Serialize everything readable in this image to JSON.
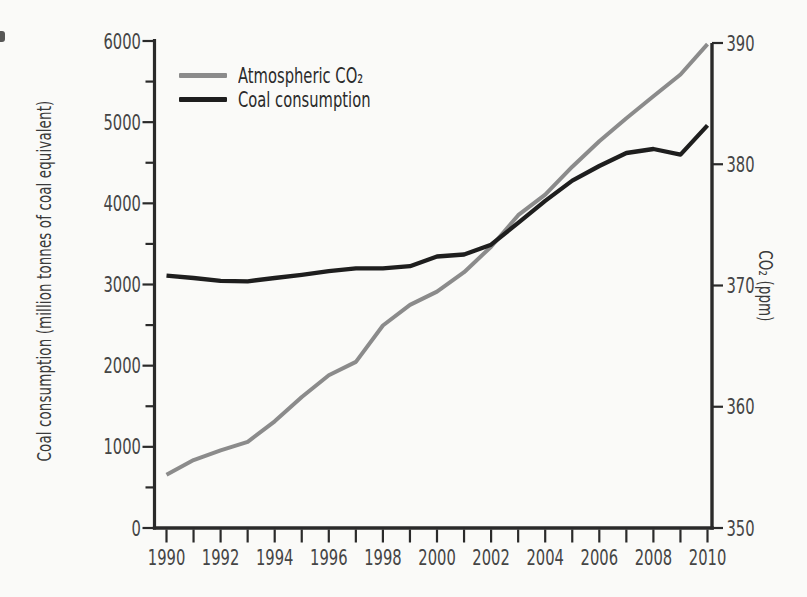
{
  "chart_data": {
    "type": "line",
    "title": "",
    "x": [
      1990,
      1991,
      1992,
      1993,
      1994,
      1995,
      1996,
      1997,
      1998,
      1999,
      2000,
      2001,
      2002,
      2003,
      2004,
      2005,
      2006,
      2007,
      2008,
      2009,
      2010
    ],
    "series": [
      {
        "name": "Atmospheric CO₂",
        "axis": "right",
        "color": "#8b8b8b",
        "stroke_width": 4,
        "values": [
          354.4,
          355.6,
          356.4,
          357.1,
          358.8,
          360.8,
          362.6,
          363.7,
          366.7,
          368.4,
          369.5,
          371.1,
          373.2,
          375.8,
          377.5,
          379.8,
          381.9,
          383.8,
          385.6,
          387.4,
          389.9
        ]
      },
      {
        "name": "Coal consumption",
        "axis": "left",
        "color": "#1e1e1e",
        "stroke_width": 4.3,
        "values": [
          3110,
          3080,
          3045,
          3040,
          3080,
          3120,
          3165,
          3200,
          3200,
          3225,
          3345,
          3370,
          3490,
          3760,
          4030,
          4280,
          4460,
          4620,
          4670,
          4600,
          4960
        ]
      }
    ],
    "left_axis": {
      "label": "Coal consumption (million tonnes of coal equivalent)",
      "min": 0,
      "max": 6000,
      "major_step": 1000,
      "minor_step": 500,
      "tick_labels": [
        "0",
        "1000",
        "2000",
        "3000",
        "4000",
        "5000",
        "6000"
      ]
    },
    "right_axis": {
      "label": "CO₂ (ppm)",
      "min": 350,
      "max": 390,
      "major_step": 10,
      "tick_labels": [
        "350",
        "360",
        "370",
        "380",
        "390"
      ]
    },
    "x_axis": {
      "min": 1990,
      "max": 2010,
      "tick_step": 1,
      "label_step": 2,
      "tick_labels": [
        "1990",
        "1992",
        "1994",
        "1996",
        "1998",
        "2000",
        "2002",
        "2004",
        "2006",
        "2008",
        "2010"
      ]
    },
    "legend": {
      "position": "top-left-inside",
      "items": [
        {
          "label": "Atmospheric CO₂",
          "color": "#8b8b8b"
        },
        {
          "label": "Coal consumption",
          "color": "#1e1e1e"
        }
      ]
    },
    "grid": false
  },
  "colors": {
    "background": "#fafaf8",
    "axis": "#2a2a2a",
    "tick_label": "#454545",
    "axis_title": "#3a3a3a"
  }
}
